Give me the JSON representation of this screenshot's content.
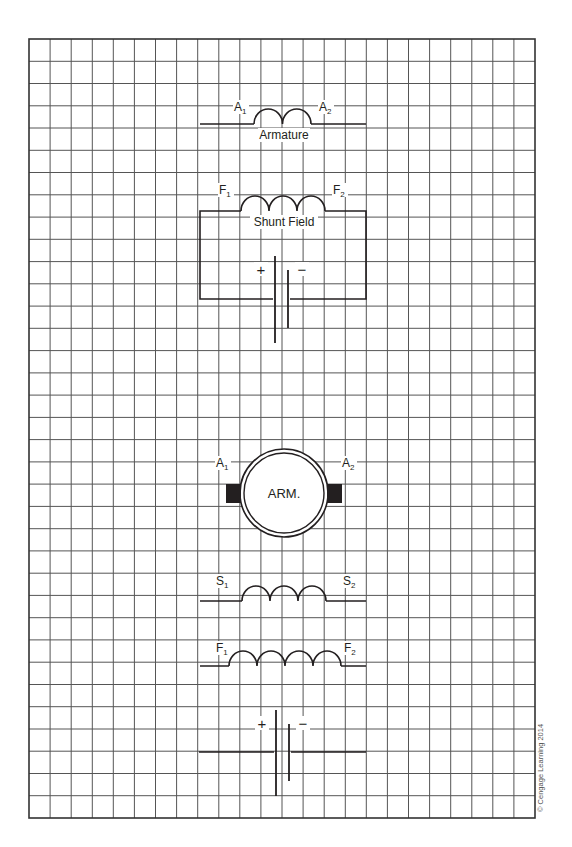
{
  "diagram": {
    "type": "dc-motor-wiring-worksheet",
    "grid": {
      "left": 29,
      "top": 39,
      "right": 535,
      "bottom": 818,
      "cols": 24,
      "rows": 35
    },
    "colors": {
      "grid": "#555555",
      "wire": "#231f20",
      "background": "#ffffff"
    },
    "components": {
      "armature_coil": {
        "label": "Armature",
        "terminal_left": "A",
        "terminal_left_sub": "1",
        "terminal_right": "A",
        "terminal_right_sub": "2",
        "loops": 2
      },
      "shunt_field_circuit": {
        "label": "Shunt Field",
        "terminal_left": "F",
        "terminal_left_sub": "1",
        "terminal_right": "F",
        "terminal_right_sub": "2",
        "loops": 3
      },
      "battery_top": {
        "positive": "+",
        "negative": "−"
      },
      "armature_symbol": {
        "label": "ARM.",
        "terminal_left": "A",
        "terminal_left_sub": "1",
        "terminal_right": "A",
        "terminal_right_sub": "2"
      },
      "series_field": {
        "terminal_left": "S",
        "terminal_left_sub": "1",
        "terminal_right": "S",
        "terminal_right_sub": "2",
        "loops": 3
      },
      "shunt_field_coil": {
        "terminal_left": "F",
        "terminal_left_sub": "1",
        "terminal_right": "F",
        "terminal_right_sub": "2",
        "loops": 4
      },
      "battery_bottom": {
        "positive": "+",
        "negative": "−"
      }
    },
    "copyright": "© Cengage Learning 2014"
  }
}
